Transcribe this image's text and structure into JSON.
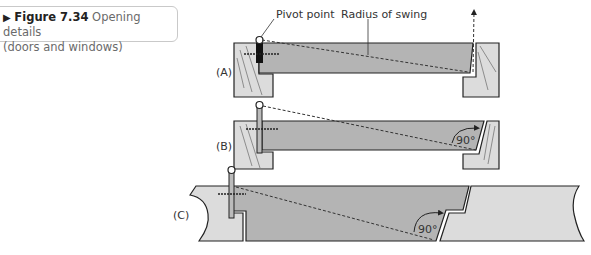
{
  "caption": {
    "marker": "▶",
    "figure_number": "Figure 7.34",
    "title_line1": "Opening details",
    "title_line2": "(doors and windows)"
  },
  "diagram": {
    "labels": {
      "pivot_point": "Pivot point",
      "radius_of_swing": "Radius of swing"
    },
    "panels": [
      {
        "id": "A",
        "label": "(A)"
      },
      {
        "id": "B",
        "label": "(B)",
        "angle": "90°"
      },
      {
        "id": "C",
        "label": "(C)",
        "angle": "90°"
      }
    ]
  },
  "colors": {
    "door_fill": "#b4b4b4",
    "frame_fill": "#dcdcdc",
    "outline": "#222222",
    "caption_border": "#c9c9c9"
  }
}
